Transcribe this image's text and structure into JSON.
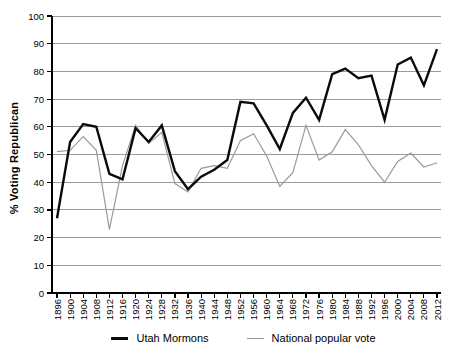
{
  "figure": {
    "y_axis_title": "% Voting Republican"
  },
  "legend": {
    "items": [
      {
        "label": "Utah Mormons"
      },
      {
        "label": "National popular vote"
      }
    ]
  },
  "chart_data": {
    "type": "line",
    "title": "",
    "xlabel": "",
    "ylabel": "% Voting Republican",
    "ylim": [
      0,
      100
    ],
    "ytick_step": 10,
    "grid": "horizontal",
    "legend_position": "bottom",
    "categories": [
      1896,
      1900,
      1904,
      1908,
      1912,
      1916,
      1920,
      1924,
      1928,
      1932,
      1936,
      1940,
      1944,
      1948,
      1952,
      1956,
      1960,
      1964,
      1968,
      1972,
      1976,
      1980,
      1984,
      1988,
      1992,
      1996,
      2000,
      2004,
      2008,
      2012
    ],
    "series": [
      {
        "name": "Utah Mormons",
        "color": "#0a0a0a",
        "stroke_width": 2.4,
        "values": [
          27,
          54.5,
          61,
          60,
          43,
          41,
          59.5,
          54.5,
          60.5,
          44,
          37.5,
          42,
          44.5,
          48,
          69,
          68.5,
          60.5,
          52,
          65,
          70.5,
          62.5,
          79,
          81,
          77.5,
          78.5,
          62.5,
          82.5,
          85,
          75,
          88
        ]
      },
      {
        "name": "National popular vote",
        "color": "#9a9a9a",
        "stroke_width": 1.2,
        "values": [
          51,
          51.5,
          56.5,
          51.5,
          23,
          46,
          60.5,
          54,
          58,
          39.5,
          36.5,
          45,
          46,
          45,
          55,
          57.5,
          49.5,
          38.5,
          43.5,
          60.5,
          48,
          51,
          59,
          53.5,
          46,
          40,
          47.5,
          50.5,
          45.5,
          47
        ]
      }
    ]
  }
}
